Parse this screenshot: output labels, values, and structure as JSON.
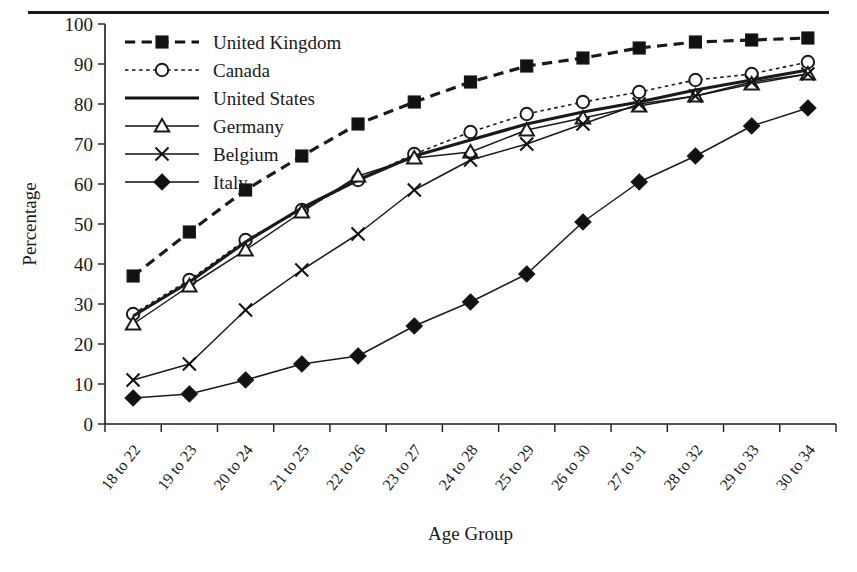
{
  "figure": {
    "top_rule": true,
    "xlabel": "Age Group",
    "ylabel": "Percentage"
  },
  "chart_data": {
    "type": "line",
    "title": "",
    "xlabel": "Age Group",
    "ylabel": "Percentage",
    "ylim": [
      0,
      100
    ],
    "ytick_step": 10,
    "grid": false,
    "legend_position": "top-left",
    "categories": [
      "18 to 22",
      "19 to 23",
      "20 to 24",
      "21 to 25",
      "22 to 26",
      "23 to 27",
      "24 to 28",
      "25 to 29",
      "26 to 30",
      "27 to 31",
      "28 to 32",
      "29 to 33",
      "30 to 34"
    ],
    "yticks": [
      0,
      10,
      20,
      30,
      40,
      50,
      60,
      70,
      80,
      90,
      100
    ],
    "series": [
      {
        "name": "United Kingdom",
        "marker": "filled-square",
        "dash": "dashed",
        "width": 3.2,
        "values": [
          37,
          48,
          58.5,
          67,
          75,
          80.5,
          85.5,
          89.5,
          91.5,
          94,
          95.5,
          96,
          96.5
        ]
      },
      {
        "name": "Canada",
        "marker": "open-circle",
        "dash": "dotted",
        "width": 1.6,
        "values": [
          27.5,
          36,
          46,
          53.5,
          61,
          67.5,
          73,
          77.5,
          80.5,
          83,
          86,
          87.5,
          90.5
        ]
      },
      {
        "name": "United States",
        "marker": "none",
        "dash": "solid",
        "width": 3.2,
        "values": [
          27,
          35.5,
          45.5,
          54,
          61,
          67,
          71,
          75,
          78,
          80.5,
          83.5,
          86,
          88.5
        ]
      },
      {
        "name": "Germany",
        "marker": "open-triangle",
        "dash": "solid",
        "width": 1.5,
        "values": [
          25,
          34.5,
          43.5,
          53,
          62,
          66.5,
          68,
          73.5,
          76.5,
          79.5,
          82,
          85,
          87.5
        ]
      },
      {
        "name": "Belgium",
        "marker": "cross-x",
        "dash": "solid",
        "width": 1.5,
        "values": [
          11,
          15,
          28.5,
          38.5,
          47.5,
          58.5,
          66,
          70,
          75,
          80,
          82,
          85.5,
          87.5
        ]
      },
      {
        "name": "Italy",
        "marker": "filled-diamond",
        "dash": "solid",
        "width": 1.5,
        "values": [
          6.5,
          7.5,
          11,
          15,
          17,
          24.5,
          30.5,
          37.5,
          50.5,
          60.5,
          67,
          74.5,
          79
        ]
      }
    ]
  }
}
